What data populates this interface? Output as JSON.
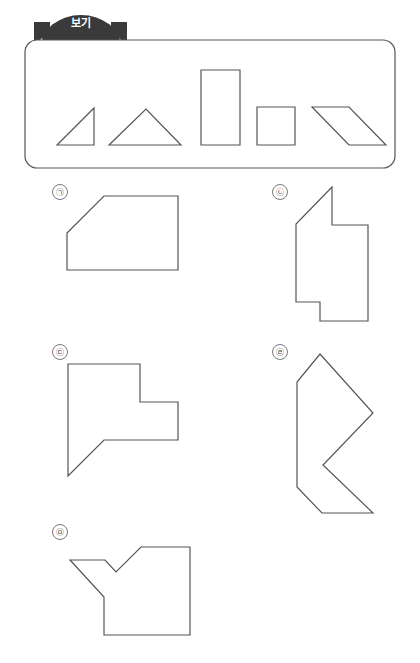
{
  "page": {
    "width": 420,
    "height": 663,
    "background": "#ffffff",
    "stroke_color": "#555555",
    "banner_color": "#3a3a3a",
    "label_color": "#4a4a4a"
  },
  "banner": {
    "label": "보기",
    "shape": "arch-ribbon",
    "fill": "#3a3a3a",
    "text_color": "#ffffff"
  },
  "reference_box": {
    "name": "reference-shapes-panel",
    "rounded": true,
    "border_color": "#555555",
    "rect": {
      "x": 25,
      "y": 40,
      "w": 370,
      "h": 128
    },
    "shapes": [
      {
        "name": "right-triangle",
        "type": "polygon",
        "points": "57,145 94,145 94,108"
      },
      {
        "name": "isosceles-triangle",
        "type": "polygon",
        "points": "109,145 181,145 146,109"
      },
      {
        "name": "tall-rectangle",
        "type": "polygon",
        "points": "201,70 240,70 240,145 201,145"
      },
      {
        "name": "small-square",
        "type": "polygon",
        "points": "257,107 295,107 295,145 257,145"
      },
      {
        "name": "parallelogram",
        "type": "polygon",
        "points": "312,107 349,107 386,145 349,145"
      }
    ]
  },
  "answer_shapes": [
    {
      "key": "a",
      "label": "㉠",
      "name": "answer-shape-a",
      "label_pos": {
        "x": 52,
        "y": 184
      },
      "points": "67,233 104,196 178,196 178,270 67,270"
    },
    {
      "key": "b",
      "label": "㉡",
      "name": "answer-shape-b",
      "label_pos": {
        "x": 272,
        "y": 184
      },
      "points": "332,187 332,225 368,225 368,321 320,321 320,302 296,302 296,224"
    },
    {
      "key": "c",
      "label": "㉢",
      "name": "answer-shape-c",
      "label_pos": {
        "x": 52,
        "y": 344
      },
      "points": "68,364 140,364 140,402 178,402 178,440 104,440 68,476"
    },
    {
      "key": "d",
      "label": "㉣",
      "name": "answer-shape-d",
      "label_pos": {
        "x": 272,
        "y": 344
      },
      "points": "320,354 373,413 323,465 373,513 322,513 297,487 297,382"
    },
    {
      "key": "e",
      "label": "㉤",
      "name": "answer-shape-e",
      "label_pos": {
        "x": 52,
        "y": 524
      },
      "points": "70,560 105,560 116,572 141,547 190,547 190,635 104,635 104,597"
    }
  ]
}
